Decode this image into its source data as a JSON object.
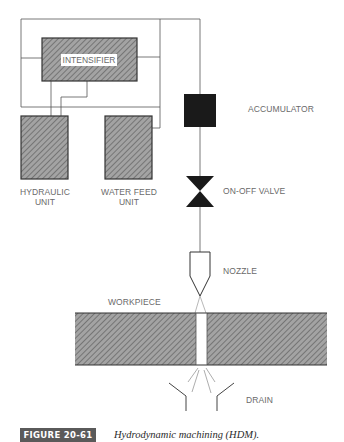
{
  "diagram": {
    "components": {
      "intensifier": "INTENSIFIER",
      "accumulator": "ACCUMULATOR",
      "hydraulic_unit_line1": "HYDRAULIC",
      "hydraulic_unit_line2": "UNIT",
      "water_feed_line1": "WATER FEED",
      "water_feed_line2": "UNIT",
      "on_off_valve": "ON-OFF VALVE",
      "nozzle": "NOZZLE",
      "workpiece": "WORKPIECE",
      "drain": "DRAIN"
    },
    "colors": {
      "hatch_fill": "#9a9a9a",
      "hatch_line": "#4a4a4a",
      "line": "#555555",
      "solid": "#1a1a1a",
      "figure_tag_bg": "#5a5a5a"
    }
  },
  "caption": {
    "figure_label": "FIGURE 20-61",
    "text": "Hydrodynamic machining (HDM)."
  }
}
